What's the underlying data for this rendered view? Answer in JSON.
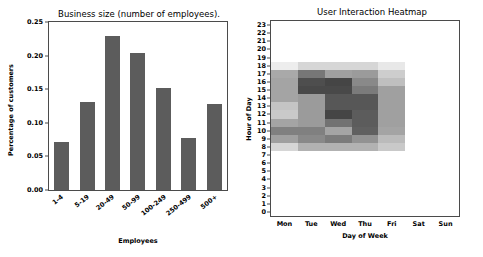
{
  "figure": {
    "panels": [
      "bar",
      "heatmap"
    ],
    "background": "#ffffff"
  },
  "bar_panel": {
    "title": "Business size (number of employees).",
    "xlabel": "Employees",
    "ylabel": "Percentage of customers",
    "yticks": [
      "0.00",
      "0.05",
      "0.10",
      "0.15",
      "0.20",
      "0.25"
    ],
    "bar_color": "#5c5c5c",
    "axis_color": "#4b4b4b"
  },
  "heat_panel": {
    "title": "User Interaction Heatmap",
    "xlabel": "Day of Week",
    "ylabel": "Hour of Day",
    "xticks": [
      "Mon",
      "Tue",
      "Wed",
      "Thu",
      "Fri",
      "Sat",
      "Sun"
    ],
    "yticks": [
      "23",
      "22",
      "21",
      "20",
      "19",
      "18",
      "17",
      "16",
      "15",
      "14",
      "13",
      "12",
      "11",
      "10",
      "9",
      "8",
      "7",
      "6",
      "5",
      "4",
      "3",
      "2",
      "1",
      "0"
    ],
    "axis_color": "#4b4b4b",
    "colormap": "greys"
  },
  "chart_data": [
    {
      "type": "bar",
      "title": "Business size (number of employees).",
      "xlabel": "Employees",
      "ylabel": "Percentage of customers",
      "categories": [
        "1-4",
        "5-19",
        "20-49",
        "50-99",
        "100-249",
        "250-499",
        "500+"
      ],
      "values": [
        0.072,
        0.131,
        0.229,
        0.204,
        0.152,
        0.077,
        0.128
      ],
      "ylim": [
        0.0,
        0.25
      ],
      "yticks": [
        0.0,
        0.05,
        0.1,
        0.15,
        0.2,
        0.25
      ],
      "grid": false,
      "legend": null,
      "bar_color": "#5c5c5c"
    },
    {
      "type": "heatmap",
      "title": "User Interaction Heatmap",
      "xlabel": "Day of Week",
      "ylabel": "Hour of Day",
      "x": [
        "Mon",
        "Tue",
        "Wed",
        "Thu",
        "Fri",
        "Sat",
        "Sun"
      ],
      "y": [
        23,
        22,
        21,
        20,
        19,
        18,
        17,
        16,
        15,
        14,
        13,
        12,
        11,
        10,
        9,
        8,
        7,
        6,
        5,
        4,
        3,
        2,
        1,
        0
      ],
      "vmin": 0,
      "vmax": 100,
      "colormap": "greys",
      "grid": false,
      "legend": null,
      "note": "rows ordered top-to-bottom matching y[] (hour 23 at top, hour 0 at bottom); values are relative interaction counts 0-100",
      "values": [
        [
          0,
          0,
          0,
          0,
          0,
          0,
          0
        ],
        [
          0,
          0,
          0,
          0,
          0,
          0,
          0
        ],
        [
          0,
          0,
          0,
          0,
          0,
          0,
          0
        ],
        [
          0,
          0,
          0,
          0,
          0,
          0,
          0
        ],
        [
          0,
          0,
          0,
          0,
          0,
          0,
          0
        ],
        [
          8,
          18,
          18,
          18,
          10,
          0,
          0
        ],
        [
          38,
          60,
          42,
          44,
          22,
          0,
          0
        ],
        [
          40,
          78,
          82,
          52,
          28,
          0,
          0
        ],
        [
          40,
          80,
          80,
          58,
          42,
          0,
          0
        ],
        [
          40,
          44,
          74,
          74,
          42,
          0,
          0
        ],
        [
          26,
          44,
          74,
          74,
          42,
          0,
          0
        ],
        [
          24,
          44,
          82,
          72,
          42,
          0,
          0
        ],
        [
          40,
          44,
          62,
          72,
          42,
          0,
          0
        ],
        [
          56,
          56,
          40,
          70,
          40,
          0,
          0
        ],
        [
          42,
          52,
          58,
          48,
          30,
          0,
          0
        ],
        [
          18,
          34,
          34,
          34,
          24,
          0,
          0
        ],
        [
          0,
          0,
          0,
          0,
          0,
          0,
          0
        ],
        [
          0,
          0,
          0,
          0,
          0,
          0,
          0
        ],
        [
          0,
          0,
          0,
          0,
          0,
          0,
          0
        ],
        [
          0,
          0,
          0,
          0,
          0,
          0,
          0
        ],
        [
          0,
          0,
          0,
          0,
          0,
          0,
          0
        ],
        [
          0,
          0,
          0,
          0,
          0,
          0,
          0
        ],
        [
          0,
          0,
          0,
          0,
          0,
          0,
          0
        ],
        [
          0,
          0,
          0,
          0,
          0,
          0,
          0
        ]
      ]
    }
  ]
}
